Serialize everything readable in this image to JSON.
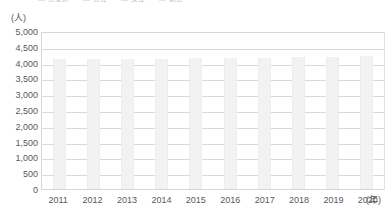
{
  "legend": {
    "truncated": true,
    "items": [
      {
        "label": "男女計"
      },
      {
        "label": "男性"
      },
      {
        "label": "女性"
      },
      {
        "label": "割合"
      }
    ]
  },
  "axes": {
    "y_unit": "(人)",
    "x_unit": "(年)"
  },
  "chart_data": {
    "type": "bar",
    "title": "",
    "subtitle": "",
    "xlabel": "(年)",
    "ylabel": "(人)",
    "categories": [
      "2011",
      "2012",
      "2013",
      "2014",
      "2015",
      "2016",
      "2017",
      "2018",
      "2019",
      "2020"
    ],
    "values": [
      4100,
      4120,
      4110,
      4130,
      4140,
      4150,
      4160,
      4180,
      4190,
      4200
    ],
    "ylim": [
      0,
      5000
    ],
    "ytick_step": 500,
    "yticks": [
      5000,
      4500,
      4000,
      3500,
      3000,
      2500,
      2000,
      1500,
      1000,
      500,
      0
    ],
    "ytick_labels": [
      "5,000",
      "4,500",
      "4,000",
      "3,500",
      "3,000",
      "2,500",
      "2,000",
      "1,500",
      "1,000",
      "500",
      "0"
    ],
    "grid": true,
    "grid_axis": "y",
    "legend_position": "top",
    "series": [
      {
        "name": "人数",
        "values": [
          4100,
          4120,
          4110,
          4130,
          4140,
          4150,
          4160,
          4180,
          4190,
          4200
        ]
      }
    ],
    "colors": {
      "bar": "#f2f2f2",
      "grid": "#d9d9db",
      "frame": "#d6d6d8",
      "text": "#59595b",
      "background": "#ffffff"
    }
  }
}
